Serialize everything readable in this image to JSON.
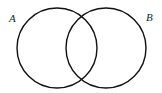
{
  "diagram": {
    "type": "venn",
    "stroke_color": "#111111",
    "background": "#ffffff",
    "sets": [
      {
        "label": "A",
        "cx": 57,
        "cy": 48,
        "r": 40,
        "label_x": 9,
        "label_y": 22
      },
      {
        "label": "B",
        "cx": 106,
        "cy": 48,
        "r": 40,
        "label_x": 146,
        "label_y": 21
      }
    ]
  }
}
